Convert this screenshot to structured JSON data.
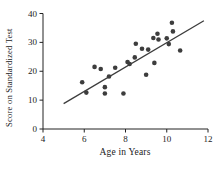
{
  "chart_data": {
    "type": "scatter",
    "title": "",
    "xlabel": "Age in Years",
    "ylabel": "Score on Standardized Test",
    "xlim": [
      4,
      12
    ],
    "ylim": [
      0,
      40
    ],
    "xticks": [
      4,
      6,
      8,
      10,
      12
    ],
    "yticks": [
      0,
      10,
      20,
      30,
      40
    ],
    "grid": false,
    "legend": "none",
    "points": [
      [
        5.9,
        16.2
      ],
      [
        6.1,
        12.6
      ],
      [
        6.5,
        21.5
      ],
      [
        6.8,
        20.8
      ],
      [
        7.0,
        14.5
      ],
      [
        7.0,
        12.3
      ],
      [
        7.2,
        18.2
      ],
      [
        7.5,
        21.2
      ],
      [
        7.9,
        12.3
      ],
      [
        8.1,
        23.2
      ],
      [
        8.2,
        22.5
      ],
      [
        8.45,
        24.8
      ],
      [
        8.5,
        29.5
      ],
      [
        8.8,
        27.8
      ],
      [
        9.0,
        18.8
      ],
      [
        9.1,
        27.5
      ],
      [
        9.35,
        31.5
      ],
      [
        9.4,
        22.9
      ],
      [
        9.55,
        33.0
      ],
      [
        9.6,
        31.0
      ],
      [
        10.0,
        31.4
      ],
      [
        10.1,
        29.4
      ],
      [
        10.25,
        36.8
      ],
      [
        10.3,
        33.8
      ],
      [
        10.65,
        27.2
      ]
    ],
    "trend_line": {
      "x1": 5.0,
      "y1": 8.8,
      "x2": 11.8,
      "y2": 37.5
    },
    "point_color": "#3d3d3d",
    "line_color": "#3d3d3d",
    "axis_color": "#222222",
    "background": "#ffffff"
  }
}
